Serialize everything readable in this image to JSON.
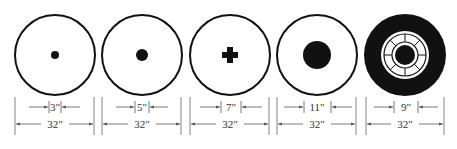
{
  "diagram": {
    "colors": {
      "ink": "#111111",
      "dim": "#555555",
      "background": "#ffffff"
    },
    "targets": [
      {
        "id": "target-1",
        "cx": 55,
        "center": "dot",
        "inner_label": "3\"",
        "outer_label": "32\""
      },
      {
        "id": "target-2",
        "cx": 142,
        "center": "dot",
        "inner_label": "5\"",
        "outer_label": "32\""
      },
      {
        "id": "target-3",
        "cx": 230,
        "center": "cross",
        "inner_label": "7\"",
        "outer_label": "32\""
      },
      {
        "id": "target-4",
        "cx": 317,
        "center": "dot",
        "inner_label": "11\"",
        "outer_label": "32\""
      },
      {
        "id": "target-5",
        "cx": 405,
        "center": "wheel",
        "inner_label": "9\"",
        "outer_label": "32\""
      }
    ]
  }
}
